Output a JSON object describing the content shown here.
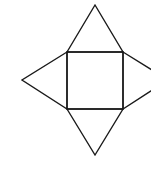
{
  "diagram": {
    "title": "",
    "type": "square pyramid net",
    "colors": {
      "stroke": "#1a1a1a",
      "fill": "#ffffff",
      "background": "#ffffff"
    },
    "stroke_width": 1.4,
    "shapes": {
      "square": {
        "x1": 67,
        "y1": 52,
        "x2": 123,
        "y2": 109
      },
      "triangle_top": {
        "points": "67,52 95,5 123,52"
      },
      "triangle_bottom": {
        "points": "67,109 95,155 123,109"
      },
      "triangle_left": {
        "points": "67,52 22,80 67,109"
      },
      "triangle_right": {
        "points": "123,52 168,80 123,109"
      }
    }
  }
}
